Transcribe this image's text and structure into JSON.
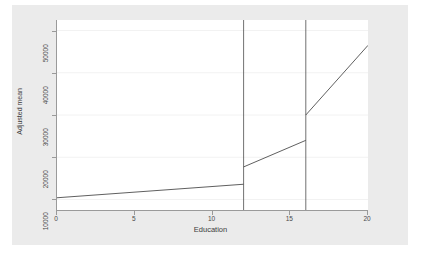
{
  "chart_data": {
    "type": "line",
    "title": "",
    "subtitle": "",
    "xlabel": "Education",
    "ylabel": "Adjusted mean",
    "xlim": [
      0,
      20
    ],
    "ylim": [
      7500,
      52500
    ],
    "x_ticks": [
      0,
      5,
      10,
      15,
      20
    ],
    "x_tick_labels": [
      "0",
      "5",
      "10",
      "15",
      "20"
    ],
    "y_ticks": [
      10000,
      20000,
      30000,
      40000,
      50000
    ],
    "y_tick_labels": [
      "10000",
      "20000",
      "30000",
      "40000",
      "50000"
    ],
    "grid": "horizontal",
    "legend": "none",
    "line_color": "#4d4d4d",
    "reference_line_color": "#4d4d4d",
    "gridline_color": "#f2f2f2",
    "axis_color": "#9a9a9a",
    "plot_background": "#ffffff",
    "graph_background": "#ebebeb",
    "page_background": "#ffffff",
    "reference_lines": [
      {
        "name": "high-school-credential",
        "x": 12
      },
      {
        "name": "college-credential",
        "x": 16
      }
    ],
    "series": [
      {
        "name": "Adjusted mean",
        "segments": [
          {
            "name": "segment-below-12",
            "points": [
              {
                "x": 0,
                "y": 10400
              },
              {
                "x": 12,
                "y": 13600
              }
            ]
          },
          {
            "name": "segment-12-to-16",
            "points": [
              {
                "x": 12,
                "y": 17700
              },
              {
                "x": 16,
                "y": 24000
              }
            ]
          },
          {
            "name": "segment-16-to-20",
            "points": [
              {
                "x": 16,
                "y": 30000
              },
              {
                "x": 20,
                "y": 46500
              }
            ]
          }
        ]
      }
    ],
    "discontinuities": [
      {
        "x": 12,
        "from": 13600,
        "to": 17700
      },
      {
        "x": 16,
        "from": 24000,
        "to": 30000
      }
    ]
  }
}
